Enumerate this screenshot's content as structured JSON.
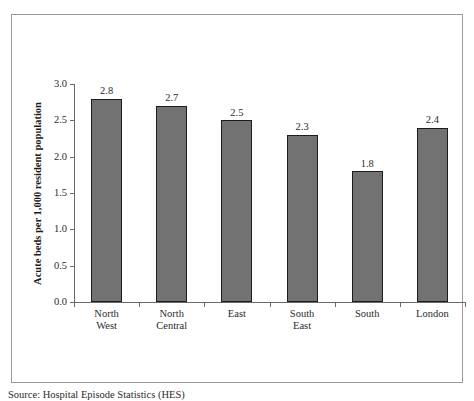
{
  "figure": {
    "caption": "Source: Hospital Episode Statistics (HES)"
  },
  "chart_data": {
    "type": "bar",
    "title": "",
    "xlabel": "",
    "ylabel": "Acute beds per 1,000 resident population",
    "categories": [
      "North West",
      "North Central",
      "East",
      "South East",
      "South",
      "London"
    ],
    "category_lines": [
      [
        "North",
        "West"
      ],
      [
        "North",
        "Central"
      ],
      [
        "East",
        ""
      ],
      [
        "South",
        "East"
      ],
      [
        "South",
        ""
      ],
      [
        "London",
        ""
      ]
    ],
    "values": [
      2.8,
      2.7,
      2.5,
      2.3,
      1.8,
      2.4
    ],
    "value_labels": [
      "2.8",
      "2.7",
      "2.5",
      "2.3",
      "1.8",
      "2.4"
    ],
    "ylim": [
      0.0,
      3.0
    ],
    "yticks": [
      0.0,
      0.5,
      1.0,
      1.5,
      2.0,
      2.5,
      3.0
    ],
    "ytick_labels": [
      "0.0",
      "0.5",
      "1.0",
      "1.5",
      "2.0",
      "2.5",
      "3.0"
    ],
    "grid": false,
    "legend": false,
    "bar_color": "#727272",
    "bar_edge_color": "#1c1c1c",
    "axis_color": "#6a6a6a",
    "frame_color": "#9a9a9a"
  }
}
